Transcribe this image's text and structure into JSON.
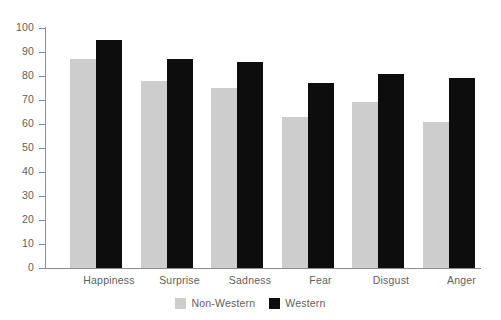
{
  "chart_data": {
    "type": "bar",
    "title": "",
    "subtitle": "",
    "xlabel": "",
    "ylabel": "",
    "categories": [
      "Happiness",
      "Surprise",
      "Sadness",
      "Fear",
      "Disgust",
      "Anger"
    ],
    "series": [
      {
        "name": "Non-Western",
        "color": "#cdcdcd",
        "values": [
          87,
          78,
          75,
          63,
          69,
          61
        ]
      },
      {
        "name": "Western",
        "color": "#0d0d0d",
        "values": [
          95,
          87,
          86,
          77,
          81,
          79
        ]
      }
    ],
    "ylim": [
      0,
      100
    ],
    "y_ticks": [
      0,
      10,
      20,
      30,
      40,
      50,
      60,
      70,
      80,
      90,
      100
    ],
    "y_tick_labels": [
      "0",
      "10",
      "20",
      "30",
      "40",
      "50",
      "60",
      "70",
      "80",
      "90",
      "100"
    ],
    "grid": false,
    "legend_position": "bottom-center",
    "legend_entries": [
      "Non-Western",
      "Western"
    ],
    "annotations": []
  },
  "colors": {
    "nonwestern": "#cdcdcd",
    "western": "#0d0d0d",
    "axis": "#8c8c8c",
    "text": "#5e5e5e",
    "background": "#ffffff"
  }
}
